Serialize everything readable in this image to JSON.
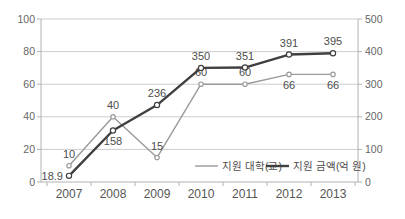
{
  "chart_data": {
    "type": "line",
    "categories": [
      "2007",
      "2008",
      "2009",
      "2010",
      "2011",
      "2012",
      "2013"
    ],
    "series": [
      {
        "name": "지원 대학(교)",
        "axis": "left",
        "values": [
          10,
          40,
          15,
          60,
          60,
          66,
          66
        ],
        "labels": [
          "10",
          "40",
          "15",
          "60",
          "60",
          "66",
          "66"
        ],
        "label_positions": [
          "above",
          "above",
          "above",
          "above",
          "above",
          "below",
          "below"
        ],
        "color": "#9a9a9a",
        "line_width": 1.4,
        "marker": "open-circle"
      },
      {
        "name": "지원 금액(억 원)",
        "axis": "right",
        "values": [
          18.9,
          158,
          236,
          350,
          351,
          391,
          395
        ],
        "labels": [
          "18.9",
          "158",
          "236",
          "350",
          "351",
          "391",
          "395"
        ],
        "label_positions": [
          "left",
          "below",
          "above",
          "above",
          "above",
          "above",
          "above"
        ],
        "color": "#3f3f3f",
        "line_width": 2.4,
        "marker": "open-circle"
      }
    ],
    "left_axis": {
      "min": 0,
      "max": 100,
      "ticks": [
        0,
        20,
        40,
        60,
        80,
        100
      ]
    },
    "right_axis": {
      "min": 0,
      "max": 500,
      "ticks": [
        0,
        100,
        200,
        300,
        400,
        500
      ]
    },
    "grid": "horizontal",
    "legend": {
      "position": "inside-bottom",
      "items": [
        "지원 대학(교)",
        "지원 금액(억 원)"
      ]
    },
    "colors": {
      "grid": "#cdcdcd",
      "axis": "#b2b2b2",
      "tick_text": "#666666",
      "label_text": "#4d4d4d",
      "category_text": "#555555",
      "marker_fill": "#ffffff"
    }
  }
}
